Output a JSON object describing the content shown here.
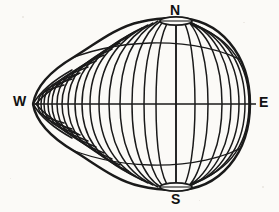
{
  "figure": {
    "style": "engraving",
    "background_color": "#fbfaf7",
    "ink_color": "#1a1a1a",
    "labels": {
      "north": "N",
      "south": "S",
      "west": "W",
      "east": "E"
    },
    "geometry": {
      "center_x": 176,
      "center_y": 105,
      "body_radius_x": 72,
      "body_radius_y": 84,
      "tip_x": 33,
      "tip_y": 104,
      "north_pole_x": 176,
      "north_pole_y": 22,
      "south_pole_x": 176,
      "south_pole_y": 186,
      "polar_opening_rx": 16,
      "polar_opening_ry": 4,
      "meridian_count": 25,
      "latitude_circle_count": 3,
      "equator_y": 104,
      "equator_x_start": 33,
      "equator_x_end": 256,
      "axis_x": 176,
      "axis_y_start": 18,
      "axis_y_end": 191
    },
    "annotations": {
      "equator_label": "equator",
      "polar_axis_label": "polar axis",
      "north_opening_label": "north polar opening",
      "south_opening_label": "south polar opening",
      "tip_label": "western taper"
    }
  }
}
